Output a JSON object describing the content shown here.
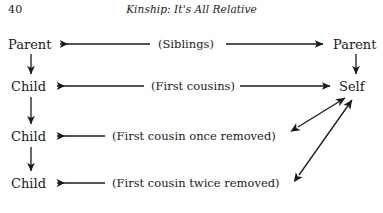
{
  "page": {
    "folio": "40",
    "running_title": "Kinship: It's All Relative",
    "background_color": "#ffffff",
    "ink_color": "#1a1a1a"
  },
  "diagram": {
    "type": "kinship-chart",
    "nodes": {
      "parent_left": "Parent",
      "parent_right": "Parent",
      "child_1": "Child",
      "child_2": "Child",
      "child_3": "Child",
      "self": "Self"
    },
    "relations": {
      "siblings": "(Siblings)",
      "first_cousins": "(First cousins)",
      "once_removed": "(First cousin once removed)",
      "twice_removed": "(First cousin twice removed)"
    },
    "rows": [
      {
        "left": "Parent",
        "label": "(Siblings)",
        "right": "Parent"
      },
      {
        "left": "Child",
        "label": "(First cousins)",
        "right": "Self"
      },
      {
        "left": "Child",
        "label": "(First cousin once removed)",
        "right": "Self"
      },
      {
        "left": "Child",
        "label": "(First cousin twice removed)",
        "right": "Self"
      }
    ],
    "descent_edges": [
      {
        "from": "Parent",
        "to": "Child",
        "direction": "down"
      },
      {
        "from": "Child",
        "to": "Child",
        "direction": "down"
      },
      {
        "from": "Child",
        "to": "Child",
        "direction": "down"
      },
      {
        "from": "Parent",
        "to": "Self",
        "direction": "down"
      }
    ]
  }
}
